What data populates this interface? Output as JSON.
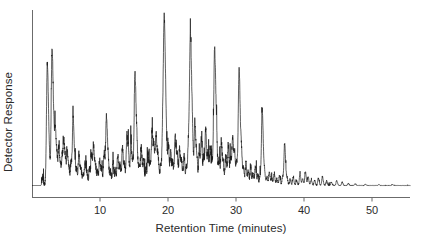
{
  "chart_data": {
    "type": "line",
    "title": "",
    "xlabel": "Retention Time (minutes)",
    "ylabel": "Detector Response",
    "xlim": [
      0,
      55.6
    ],
    "ylim": [
      0,
      1.0
    ],
    "xticks": [
      10,
      20,
      30,
      40,
      50
    ],
    "xtick_labels": [
      "10",
      "20",
      "30",
      "40",
      "50"
    ],
    "yticks": [],
    "ytick_labels": [],
    "grid": false,
    "legend": null,
    "series": [
      {
        "name": "chromatogram",
        "color": "#1a1a1a",
        "baseline": 0.0,
        "comment": "Gas chromatogram trace: peak list as [retention_time_minutes, relative_height_0to1]. Baseline noise between peaks is near zero.",
        "peaks": [
          [
            1.55,
            0.045
          ],
          [
            2.25,
            0.76
          ],
          [
            2.55,
            0.09
          ],
          [
            2.95,
            0.845
          ],
          [
            3.25,
            0.15
          ],
          [
            3.45,
            0.3
          ],
          [
            3.7,
            0.12
          ],
          [
            3.95,
            0.215
          ],
          [
            4.2,
            0.095
          ],
          [
            4.45,
            0.175
          ],
          [
            4.7,
            0.255
          ],
          [
            4.95,
            0.11
          ],
          [
            5.2,
            0.185
          ],
          [
            5.45,
            0.085
          ],
          [
            5.75,
            0.135
          ],
          [
            6.05,
            0.42
          ],
          [
            6.35,
            0.105
          ],
          [
            6.6,
            0.075
          ],
          [
            6.9,
            0.195
          ],
          [
            7.2,
            0.09
          ],
          [
            7.5,
            0.06
          ],
          [
            7.8,
            0.13
          ],
          [
            8.1,
            0.07
          ],
          [
            8.45,
            0.1
          ],
          [
            8.75,
            0.185
          ],
          [
            9.05,
            0.24
          ],
          [
            9.35,
            0.11
          ],
          [
            9.65,
            0.075
          ],
          [
            9.95,
            0.15
          ],
          [
            10.25,
            0.09
          ],
          [
            10.6,
            0.2
          ],
          [
            10.95,
            0.43
          ],
          [
            11.25,
            0.105
          ],
          [
            11.55,
            0.075
          ],
          [
            11.9,
            0.145
          ],
          [
            12.25,
            0.095
          ],
          [
            12.6,
            0.19
          ],
          [
            12.95,
            0.12
          ],
          [
            13.3,
            0.23
          ],
          [
            13.6,
            0.105
          ],
          [
            13.95,
            0.3
          ],
          [
            14.2,
            0.15
          ],
          [
            14.55,
            0.255
          ],
          [
            14.85,
            0.12
          ],
          [
            15.15,
            0.68
          ],
          [
            15.45,
            0.17
          ],
          [
            15.75,
            0.11
          ],
          [
            16.05,
            0.23
          ],
          [
            16.4,
            0.15
          ],
          [
            16.75,
            0.095
          ],
          [
            17.05,
            0.185
          ],
          [
            17.35,
            0.12
          ],
          [
            17.65,
            0.33
          ],
          [
            17.95,
            0.21
          ],
          [
            18.25,
            0.31
          ],
          [
            18.55,
            0.16
          ],
          [
            18.9,
            0.115
          ],
          [
            19.2,
            0.275
          ],
          [
            19.45,
            1.0
          ],
          [
            19.75,
            0.15
          ],
          [
            20.05,
            0.23
          ],
          [
            20.4,
            0.19
          ],
          [
            20.7,
            0.125
          ],
          [
            21.05,
            0.3
          ],
          [
            21.35,
            0.165
          ],
          [
            21.7,
            0.225
          ],
          [
            22.0,
            0.13
          ],
          [
            22.35,
            0.185
          ],
          [
            22.7,
            0.11
          ],
          [
            23.0,
            0.25
          ],
          [
            23.3,
            0.92
          ],
          [
            23.6,
            0.18
          ],
          [
            23.95,
            0.39
          ],
          [
            24.25,
            0.145
          ],
          [
            24.6,
            0.2
          ],
          [
            24.9,
            0.275
          ],
          [
            25.25,
            0.16
          ],
          [
            25.55,
            0.33
          ],
          [
            25.9,
            0.185
          ],
          [
            26.2,
            0.22
          ],
          [
            26.5,
            0.13
          ],
          [
            26.85,
            0.84
          ],
          [
            27.15,
            0.2
          ],
          [
            27.5,
            0.15
          ],
          [
            27.85,
            0.255
          ],
          [
            28.15,
            0.115
          ],
          [
            28.5,
            0.18
          ],
          [
            28.85,
            0.24
          ],
          [
            29.2,
            0.16
          ],
          [
            29.5,
            0.29
          ],
          [
            29.8,
            0.19
          ],
          [
            30.1,
            0.125
          ],
          [
            30.45,
            0.72
          ],
          [
            30.8,
            0.175
          ],
          [
            31.1,
            0.095
          ],
          [
            31.45,
            0.14
          ],
          [
            31.8,
            0.08
          ],
          [
            32.15,
            0.105
          ],
          [
            32.5,
            0.07
          ],
          [
            32.85,
            0.12
          ],
          [
            33.2,
            0.06
          ],
          [
            33.55,
            0.055
          ],
          [
            33.85,
            0.47
          ],
          [
            34.2,
            0.075
          ],
          [
            34.55,
            0.05
          ],
          [
            34.9,
            0.085
          ],
          [
            35.25,
            0.045
          ],
          [
            35.6,
            0.07
          ],
          [
            36.0,
            0.04
          ],
          [
            36.4,
            0.06
          ],
          [
            36.85,
            0.055
          ],
          [
            37.15,
            0.26
          ],
          [
            37.5,
            0.045
          ],
          [
            37.95,
            0.035
          ],
          [
            38.4,
            0.05
          ],
          [
            38.9,
            0.03
          ],
          [
            39.4,
            0.07
          ],
          [
            39.8,
            0.04
          ],
          [
            40.2,
            0.085
          ],
          [
            40.6,
            0.05
          ],
          [
            41.05,
            0.035
          ],
          [
            41.55,
            0.03
          ],
          [
            42.1,
            0.045
          ],
          [
            42.7,
            0.055
          ],
          [
            43.3,
            0.025
          ],
          [
            44.0,
            0.02
          ],
          [
            44.8,
            0.03
          ],
          [
            45.6,
            0.02
          ],
          [
            46.5,
            0.012
          ],
          [
            47.5,
            0.01
          ],
          [
            49.0,
            0.008
          ],
          [
            51.0,
            0.006
          ],
          [
            53.0,
            0.005
          ]
        ]
      }
    ]
  },
  "axes": {
    "line_color": "#555555",
    "trace_color": "#1a1a1a"
  }
}
